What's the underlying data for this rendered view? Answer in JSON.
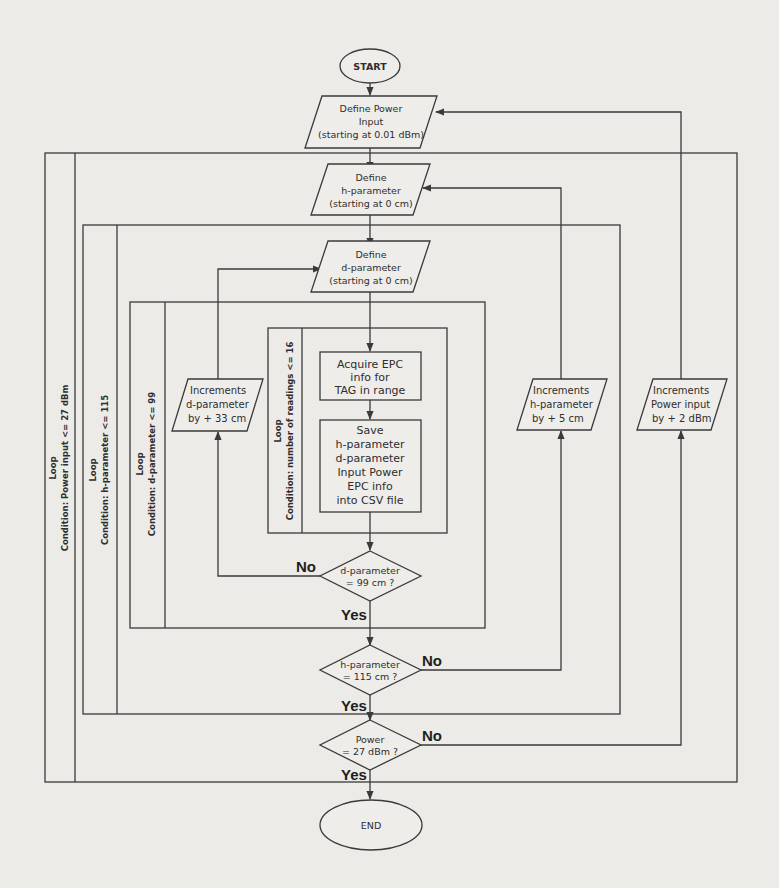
{
  "flowchart": {
    "start": "START",
    "end": "END",
    "define_power": [
      "Define Power",
      "Input",
      "(starting at 0.01 dBm)"
    ],
    "define_h": [
      "Define",
      "h-parameter",
      "(starting at 0 cm)"
    ],
    "define_d": [
      "Define",
      "d-parameter",
      "(starting at 0 cm)"
    ],
    "acquire": [
      "Acquire EPC",
      "info for",
      "TAG in range"
    ],
    "save": [
      "Save",
      "h-parameter",
      "d-parameter",
      "Input Power",
      "EPC info",
      "into CSV file"
    ],
    "inc_d": [
      "Increments",
      "d-parameter",
      "by + 33 cm"
    ],
    "inc_h": [
      "Increments",
      "h-parameter",
      "by + 5 cm"
    ],
    "inc_power": [
      "Increments",
      "Power input",
      "by + 2 dBm"
    ],
    "decision_d": [
      "d-parameter",
      "= 99 cm ?"
    ],
    "decision_h": [
      "h-parameter",
      "= 115 cm ?"
    ],
    "decision_power": [
      "Power",
      "= 27 dBm ?"
    ],
    "yes": "Yes",
    "no": "No",
    "loops": [
      {
        "title": "Loop",
        "condition": "Condition: Power input <= 27 dBm"
      },
      {
        "title": "Loop",
        "condition": "Condition: h-parameter <= 115"
      },
      {
        "title": "Loop",
        "condition": "Condition: d-parameter <= 99"
      },
      {
        "title": "Loop",
        "condition": "Condition: number of readings <= 16"
      }
    ]
  },
  "colors": {
    "background": "#ecebe8",
    "stroke": "#3a3a3a",
    "text": "#2e2e2e"
  }
}
